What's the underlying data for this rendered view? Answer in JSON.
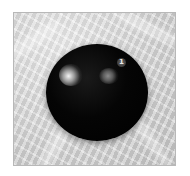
{
  "image": {
    "description": "Glossy black sphere resting on a crumpled light grey fabric background",
    "background_color": "#d6d6d6",
    "sphere_color": "#000000",
    "frame_border_color": "#b8b8b8"
  },
  "sphere": {
    "badge_label": "1"
  }
}
